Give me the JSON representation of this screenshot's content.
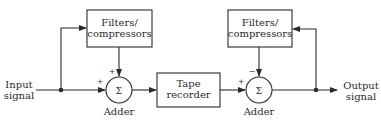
{
  "diagram": {
    "input": {
      "line1": "Input",
      "line2": "signal"
    },
    "output": {
      "line1": "Output",
      "line2": "signal"
    },
    "filter_left": {
      "line1": "Filters/",
      "line2": "compressors"
    },
    "filter_right": {
      "line1": "Filters/",
      "line2": "compressors"
    },
    "tape": {
      "line1": "Tape",
      "line2": "recorder"
    },
    "adder_left": {
      "symbol": "Σ",
      "label": "Adder",
      "sign_top": "+",
      "sign_left": "+"
    },
    "adder_right": {
      "symbol": "Σ",
      "label": "Adder",
      "sign_top": "−",
      "sign_left": "+"
    }
  }
}
